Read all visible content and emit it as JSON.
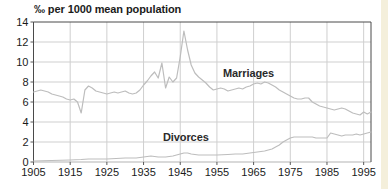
{
  "colors": {
    "background": "#ffffff",
    "plot_border": "#4a4a4a",
    "gridline": "#cfcfcf",
    "zero_axis": "#b3b3b3",
    "tick": "#5a5a5a",
    "line": "#bdbdbd",
    "text": "#1b1b1b",
    "edge_strip": "#f4efdb"
  },
  "chart_data": {
    "type": "line",
    "title": "‰ per 1000 mean population",
    "xlabel": "",
    "ylabel": "",
    "xlim": [
      1905,
      1997
    ],
    "ylim": [
      0,
      14
    ],
    "x_ticks": [
      1905,
      1915,
      1925,
      1935,
      1945,
      1955,
      1965,
      1975,
      1985,
      1995
    ],
    "y_ticks": [
      0,
      2,
      4,
      6,
      8,
      10,
      12,
      14
    ],
    "grid": true,
    "legend": "none",
    "series": [
      {
        "name": "Marriages",
        "points": [
          [
            1905,
            7.0
          ],
          [
            1906,
            7.1
          ],
          [
            1907,
            7.2
          ],
          [
            1908,
            7.1
          ],
          [
            1909,
            7.0
          ],
          [
            1910,
            6.8
          ],
          [
            1911,
            6.7
          ],
          [
            1912,
            6.6
          ],
          [
            1913,
            6.5
          ],
          [
            1914,
            6.3
          ],
          [
            1915,
            6.2
          ],
          [
            1916,
            6.3
          ],
          [
            1917,
            6.0
          ],
          [
            1918,
            4.9
          ],
          [
            1919,
            7.2
          ],
          [
            1920,
            7.6
          ],
          [
            1921,
            7.4
          ],
          [
            1922,
            7.1
          ],
          [
            1923,
            7.0
          ],
          [
            1924,
            6.9
          ],
          [
            1925,
            6.8
          ],
          [
            1926,
            6.9
          ],
          [
            1927,
            7.0
          ],
          [
            1928,
            6.9
          ],
          [
            1929,
            7.0
          ],
          [
            1930,
            7.1
          ],
          [
            1931,
            6.9
          ],
          [
            1932,
            6.8
          ],
          [
            1933,
            6.9
          ],
          [
            1934,
            7.2
          ],
          [
            1935,
            7.7
          ],
          [
            1936,
            8.1
          ],
          [
            1937,
            8.6
          ],
          [
            1938,
            9.0
          ],
          [
            1939,
            8.4
          ],
          [
            1940,
            9.9
          ],
          [
            1941,
            7.4
          ],
          [
            1942,
            8.5
          ],
          [
            1943,
            8.0
          ],
          [
            1944,
            8.4
          ],
          [
            1945,
            10.5
          ],
          [
            1946,
            13.1
          ],
          [
            1947,
            11.2
          ],
          [
            1948,
            9.7
          ],
          [
            1949,
            8.9
          ],
          [
            1950,
            8.5
          ],
          [
            1951,
            8.2
          ],
          [
            1952,
            7.9
          ],
          [
            1953,
            7.5
          ],
          [
            1954,
            7.2
          ],
          [
            1955,
            7.3
          ],
          [
            1956,
            7.4
          ],
          [
            1957,
            7.3
          ],
          [
            1958,
            7.1
          ],
          [
            1959,
            7.2
          ],
          [
            1960,
            7.3
          ],
          [
            1961,
            7.4
          ],
          [
            1962,
            7.3
          ],
          [
            1963,
            7.5
          ],
          [
            1964,
            7.6
          ],
          [
            1965,
            7.8
          ],
          [
            1966,
            7.9
          ],
          [
            1967,
            7.8
          ],
          [
            1968,
            8.0
          ],
          [
            1969,
            7.9
          ],
          [
            1970,
            7.7
          ],
          [
            1971,
            7.5
          ],
          [
            1972,
            7.2
          ],
          [
            1973,
            7.0
          ],
          [
            1974,
            6.8
          ],
          [
            1975,
            6.6
          ],
          [
            1976,
            6.4
          ],
          [
            1977,
            6.3
          ],
          [
            1978,
            6.3
          ],
          [
            1979,
            6.4
          ],
          [
            1980,
            6.4
          ],
          [
            1981,
            6.0
          ],
          [
            1982,
            5.8
          ],
          [
            1983,
            5.6
          ],
          [
            1984,
            5.5
          ],
          [
            1985,
            5.4
          ],
          [
            1986,
            5.3
          ],
          [
            1987,
            5.2
          ],
          [
            1988,
            5.3
          ],
          [
            1989,
            5.4
          ],
          [
            1990,
            5.3
          ],
          [
            1991,
            5.1
          ],
          [
            1992,
            4.9
          ],
          [
            1993,
            4.8
          ],
          [
            1994,
            4.7
          ],
          [
            1995,
            5.0
          ],
          [
            1996,
            4.8
          ],
          [
            1997,
            5.0
          ]
        ]
      },
      {
        "name": "Divorces",
        "points": [
          [
            1905,
            0.1
          ],
          [
            1910,
            0.15
          ],
          [
            1915,
            0.2
          ],
          [
            1918,
            0.25
          ],
          [
            1920,
            0.3
          ],
          [
            1925,
            0.3
          ],
          [
            1930,
            0.4
          ],
          [
            1933,
            0.4
          ],
          [
            1935,
            0.5
          ],
          [
            1937,
            0.6
          ],
          [
            1939,
            0.5
          ],
          [
            1941,
            0.5
          ],
          [
            1943,
            0.6
          ],
          [
            1945,
            0.8
          ],
          [
            1946,
            0.9
          ],
          [
            1947,
            0.9
          ],
          [
            1948,
            0.8
          ],
          [
            1950,
            0.7
          ],
          [
            1952,
            0.7
          ],
          [
            1955,
            0.7
          ],
          [
            1958,
            0.75
          ],
          [
            1960,
            0.8
          ],
          [
            1962,
            0.8
          ],
          [
            1964,
            0.9
          ],
          [
            1966,
            1.0
          ],
          [
            1968,
            1.1
          ],
          [
            1970,
            1.3
          ],
          [
            1971,
            1.5
          ],
          [
            1972,
            1.7
          ],
          [
            1973,
            2.0
          ],
          [
            1974,
            2.2
          ],
          [
            1975,
            2.4
          ],
          [
            1976,
            2.5
          ],
          [
            1977,
            2.5
          ],
          [
            1978,
            2.5
          ],
          [
            1979,
            2.5
          ],
          [
            1980,
            2.5
          ],
          [
            1981,
            2.5
          ],
          [
            1982,
            2.4
          ],
          [
            1983,
            2.4
          ],
          [
            1984,
            2.4
          ],
          [
            1985,
            2.4
          ],
          [
            1986,
            2.9
          ],
          [
            1987,
            2.8
          ],
          [
            1988,
            2.7
          ],
          [
            1989,
            2.6
          ],
          [
            1990,
            2.7
          ],
          [
            1991,
            2.7
          ],
          [
            1992,
            2.7
          ],
          [
            1993,
            2.8
          ],
          [
            1994,
            2.7
          ],
          [
            1995,
            2.8
          ],
          [
            1996,
            2.9
          ],
          [
            1997,
            3.0
          ]
        ]
      }
    ]
  }
}
